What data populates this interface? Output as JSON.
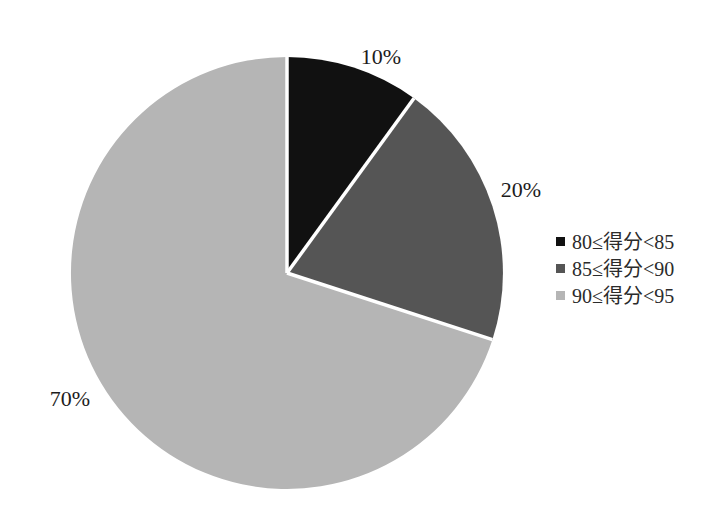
{
  "figure": {
    "background_color": "#ffffff",
    "text_color": "#1c1c1c"
  },
  "chart_data": {
    "type": "pie",
    "title": "",
    "labels": [
      "80≤得分<85",
      "85≤得分<90",
      "90≤得分<95"
    ],
    "values": [
      10,
      20,
      70
    ],
    "unit": "percent",
    "slice_labels": [
      "10%",
      "20%",
      "70%"
    ],
    "colors": [
      "#111111",
      "#555555",
      "#b5b5b5"
    ],
    "separator_color": "#ffffff",
    "start_angle_deg": 0,
    "direction": "clockwise",
    "legend_position": "right",
    "grid": false
  }
}
